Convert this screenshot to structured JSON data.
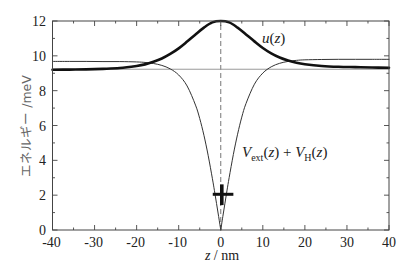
{
  "chart_data": {
    "type": "line",
    "title": "",
    "xlabel": "z / nm",
    "ylabel": "エネルギー /meV",
    "xlim": [
      -40,
      40
    ],
    "ylim": [
      0,
      12
    ],
    "xticks": [
      -40,
      -30,
      -20,
      -10,
      0,
      10,
      20,
      30,
      40
    ],
    "xticks_minor_step": 5,
    "yticks": [
      0,
      2,
      4,
      6,
      8,
      10,
      12
    ],
    "yticks_minor_step": 1,
    "grid": false,
    "legend": null,
    "series": [
      {
        "name": "u(z)",
        "style": "thick",
        "color": "#111111",
        "x": [
          -40,
          -36,
          -32,
          -28,
          -24,
          -20,
          -18,
          -16,
          -14,
          -12,
          -10,
          -8,
          -6,
          -4,
          -2,
          0,
          2,
          4,
          6,
          8,
          10,
          12,
          14,
          16,
          18,
          20,
          24,
          28,
          32,
          36,
          40
        ],
        "y": [
          9.2,
          9.21,
          9.22,
          9.25,
          9.3,
          9.42,
          9.51,
          9.66,
          9.85,
          10.11,
          10.43,
          10.82,
          11.23,
          11.62,
          11.92,
          12.0,
          11.92,
          11.62,
          11.23,
          10.83,
          10.45,
          10.14,
          9.9,
          9.73,
          9.6,
          9.52,
          9.42,
          9.37,
          9.35,
          9.33,
          9.32
        ]
      },
      {
        "name": "V_ext(z) + V_H(z)",
        "style": "thin",
        "color": "#333333",
        "cusp_x": 0,
        "x": [
          -40,
          -36,
          -32,
          -28,
          -24,
          -20,
          -18,
          -16,
          -14,
          -12,
          -10,
          -8,
          -6,
          -5,
          -4,
          -3,
          -2,
          -1.5,
          -1,
          -0.5,
          0,
          0.5,
          1,
          1.5,
          2,
          3,
          4,
          5,
          6,
          8,
          10,
          12,
          14,
          16,
          18,
          20,
          24,
          28,
          32,
          36,
          40
        ],
        "y": [
          9.68,
          9.68,
          9.68,
          9.67,
          9.67,
          9.65,
          9.62,
          9.56,
          9.45,
          9.25,
          8.9,
          8.27,
          7.17,
          6.4,
          5.44,
          4.29,
          2.97,
          2.26,
          1.52,
          0.77,
          0,
          0.78,
          1.54,
          2.29,
          3.01,
          4.34,
          5.5,
          6.48,
          7.26,
          8.37,
          9.01,
          9.37,
          9.57,
          9.68,
          9.74,
          9.77,
          9.79,
          9.8,
          9.8,
          9.8,
          9.8
        ]
      },
      {
        "name": "horizontal reference level",
        "style": "thin-gray",
        "color": "#9a9a9a",
        "x": [
          -40,
          40
        ],
        "y": [
          9.23,
          9.23
        ]
      }
    ],
    "vlines": [
      {
        "x": 0,
        "y": [
          0,
          12
        ],
        "style": "dashed",
        "color": "#666666"
      }
    ],
    "markers": [
      {
        "x": 0.25,
        "y": 2.05,
        "x_range": [
          -1.9,
          3.0
        ],
        "y_range": [
          1.43,
          2.62
        ],
        "shape": "cross",
        "color": "#111111"
      }
    ],
    "annotations": [
      {
        "id": "u",
        "text": "u(z)",
        "x": 9.8,
        "y": 10.73
      },
      {
        "id": "v",
        "text": "V_ext(z) + V_H(z)",
        "x": 5.05,
        "y": 4.19
      }
    ]
  },
  "display": {
    "xlabel_parts": [
      "z",
      " / nm"
    ],
    "ylabel": "エネルギー /meV",
    "u_label": {
      "fn": "u",
      "arg": "(z)"
    },
    "v_label": {
      "v1": "V",
      "sub1": "ext",
      "mid": "(z) + ",
      "v2": "V",
      "sub2": "H",
      "tail": "(z)"
    }
  }
}
